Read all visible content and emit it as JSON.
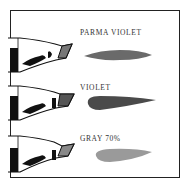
{
  "swatches": [
    {
      "name": "PARMA VIOLET",
      "color": "#6a6a6a"
    },
    {
      "name": "VIOLET",
      "color": "#4a4a4a"
    },
    {
      "name": "GRAY 70%",
      "color": "#9a9a9a"
    }
  ],
  "colors": {
    "border": "#222222",
    "ink": "#111111",
    "background": "#ffffff"
  }
}
